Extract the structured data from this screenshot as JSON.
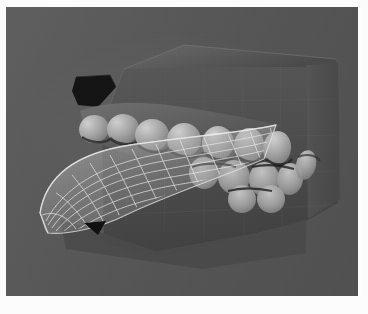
{
  "page": {
    "background_color": "#fdfdfd",
    "caption": ""
  },
  "viewport": {
    "label": "3d-render-viewport",
    "background_color": "#595959",
    "width": 352,
    "height": 289,
    "left": 6,
    "top": 7
  },
  "scene": {
    "title": "Dental arch 3D model with wireframe occlusal surface",
    "render_style": "grayscale shaded 3D model",
    "objects": [
      {
        "name": "jaw-block",
        "label": "Maxillary jaw base block",
        "color": "#4d4d4d"
      },
      {
        "name": "gingiva-body",
        "label": "Gingival / alveolar body",
        "color": "#585858"
      },
      {
        "name": "teeth-upper",
        "label": "Upper tooth row",
        "color": "#a9a9a9"
      },
      {
        "name": "teeth-lower",
        "label": "Lower tooth row",
        "color": "#9d9d9d"
      },
      {
        "name": "wireframe-surface",
        "label": "Wireframe occlusal splint surface",
        "color": "#e8e8e8"
      },
      {
        "name": "dark-notch",
        "label": "Dark cut-out notch",
        "color": "#141414"
      }
    ],
    "colors": {
      "background": "#595959",
      "block_face": "#4d4d4d",
      "block_face_light": "#636363",
      "tooth_light": "#bcbcbc",
      "tooth_mid": "#9a9a9a",
      "tooth_shadow": "#3a3a3a",
      "wire_line": "#e6e6e6",
      "wire_fill": "#8d8d8d",
      "notch_dark": "#121212",
      "grid_line": "#525252"
    },
    "teeth_upper_count": 6,
    "teeth_lower_count": 6,
    "wireframe": {
      "radial_lines": 12,
      "concentric_lines": 9,
      "style": "quadrilateral mesh"
    }
  }
}
